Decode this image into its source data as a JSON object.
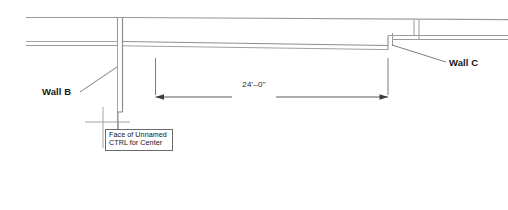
{
  "drawing": {
    "type": "architectural-plan-detail",
    "title": "Wall layout dimension detail",
    "background_color": "#ffffff",
    "line_color": "#8a8a8a",
    "dark_line_color": "#3c3c3c",
    "text_color": "#161616"
  },
  "labels": {
    "wall_b": "Wall B",
    "wall_c": "Wall C"
  },
  "dimension": {
    "value": "24'–0\"",
    "start_x": 155,
    "end_x": 388,
    "line_y": 97
  },
  "callout": {
    "line1": "Face of Unnamed",
    "line2": "CTRL for Center"
  }
}
